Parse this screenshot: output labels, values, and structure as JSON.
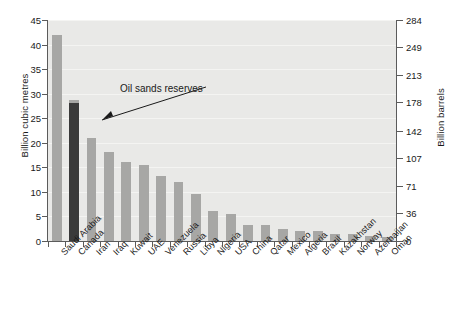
{
  "chart_data": {
    "type": "bar",
    "title": "",
    "subtitle": "",
    "xlabel": "",
    "ylabel": "Billion cubic metres",
    "ylabel_secondary": "Billion barrels",
    "ylim": [
      0,
      45
    ],
    "ylim_secondary": [
      0,
      284
    ],
    "yticks": [
      0,
      5,
      10,
      15,
      20,
      25,
      30,
      35,
      40,
      45
    ],
    "yticks_secondary": [
      0,
      36,
      71,
      107,
      142,
      178,
      213,
      249,
      284
    ],
    "grid": true,
    "legend": "none",
    "categories": [
      "Saudi Arabia",
      "Canada",
      "Iran",
      "Iraq",
      "Kuwait",
      "UAE",
      "Venezuela",
      "Russia",
      "Libya",
      "Nigeria",
      "USA",
      "China",
      "Qatar",
      "Mexico",
      "Algeria",
      "Brazil",
      "Kazakhstan",
      "Norway",
      "Azerbaijan",
      "Oman"
    ],
    "values": [
      42.0,
      28.2,
      21.0,
      18.2,
      16.0,
      15.5,
      13.3,
      12.0,
      9.5,
      6.2,
      5.5,
      3.3,
      3.2,
      2.5,
      2.1,
      2.0,
      1.5,
      1.4,
      1.0,
      0.9
    ],
    "highlight_index": 1,
    "highlight_label": "Oil sands reserves",
    "highlight_base_value": 27.0,
    "annotations": [
      {
        "text": "Oil sands reserves",
        "points_at": "Canada"
      }
    ],
    "colors": {
      "bar": "#a7a7a5",
      "bar_highlight": "#3a3a3a",
      "plot_background": "#e9e9e7",
      "gridline": "#f4f4f2",
      "axis": "#5b5b5b",
      "text": "#1a1a1a",
      "page_background": "#ffffff"
    }
  }
}
